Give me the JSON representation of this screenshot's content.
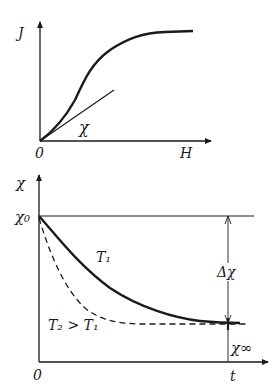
{
  "diagram": {
    "top_plot": {
      "y_axis_label": "J",
      "x_axis_label": "H",
      "origin_label": "0",
      "tangent_label": "χ",
      "description": "Magnetization J vs field H, S-shaped curve saturating; initial tangent slope χ"
    },
    "bottom_plot": {
      "y_axis_label": "χ",
      "x_axis_label": "t",
      "origin_label": "0",
      "initial_value_label": "χ₀",
      "final_value_label": "χ∞",
      "delta_label": "Δχ",
      "curve_T1_label": "T₁",
      "curve_T2_label": "T₂ > T₁",
      "description": "Susceptibility χ decays over time from χ₀ to χ∞; faster decay (dashed) at higher temperature T₂"
    },
    "colors": {
      "ink": "#1a1a1a",
      "background": "#ffffff"
    }
  }
}
